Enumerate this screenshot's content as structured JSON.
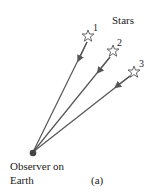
{
  "title_label": "Stars",
  "stars": [
    {
      "id": "1",
      "label": "1"
    },
    {
      "id": "2",
      "label": "2"
    },
    {
      "id": "3",
      "label": "3"
    }
  ],
  "observer": {
    "line1": "Observer on",
    "line2": "Earth"
  },
  "panel_label": "(a)",
  "colors": {
    "line": "#555555",
    "star_stroke": "#555555",
    "observer_dot": "#444444",
    "text": "#222222"
  }
}
